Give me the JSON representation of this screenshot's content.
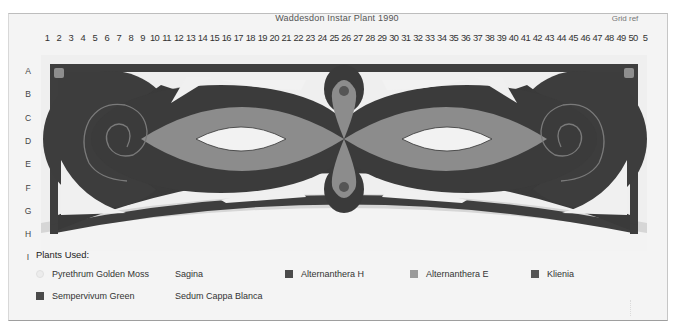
{
  "header": {
    "title": "Waddesdon Instar Plant 1990",
    "right_label": "Grid ref"
  },
  "grid": {
    "columns": [
      "1",
      "2",
      "3",
      "4",
      "5",
      "6",
      "7",
      "8",
      "9",
      "10",
      "11",
      "12",
      "13",
      "14",
      "15",
      "16",
      "17",
      "18",
      "19",
      "20",
      "21",
      "22",
      "23",
      "24",
      "25",
      "26",
      "27",
      "28",
      "29",
      "30",
      "31",
      "32",
      "33",
      "34",
      "35",
      "36",
      "37",
      "38",
      "39",
      "40",
      "41",
      "42",
      "43",
      "44",
      "45",
      "46",
      "47",
      "48",
      "49",
      "50",
      "5"
    ],
    "rows": [
      "A",
      "B",
      "C",
      "D",
      "E",
      "F",
      "G",
      "H",
      "I"
    ]
  },
  "colors": {
    "border_dark": "#3f3f3f",
    "alternanthera_e": "#8a8a8a",
    "sagina": "#ececec",
    "pyrethrum": "#cfcfcf",
    "kliena": "#4a4a4a",
    "sempervivum": "#505050",
    "sedum": "#f6f6f6"
  },
  "legend": {
    "title": "Plants Used:",
    "items": [
      {
        "label": "Pyrethrum Golden Moss",
        "swatch": "#e6e6e6",
        "shape": "circle"
      },
      {
        "label": "Sagina",
        "swatch": "transparent",
        "shape": "none"
      },
      {
        "label": "Alternanthera H",
        "swatch": "#4b4b4b",
        "shape": "square"
      },
      {
        "label": "Alternanthera E",
        "swatch": "#9a9a9a",
        "shape": "square"
      },
      {
        "label": "Klienia",
        "swatch": "#555555",
        "shape": "square"
      },
      {
        "label": "Sempervivum Green",
        "swatch": "#4a4a4a",
        "shape": "square"
      },
      {
        "label": "Sedum Cappa Blanca",
        "swatch": "transparent",
        "shape": "none"
      }
    ]
  }
}
